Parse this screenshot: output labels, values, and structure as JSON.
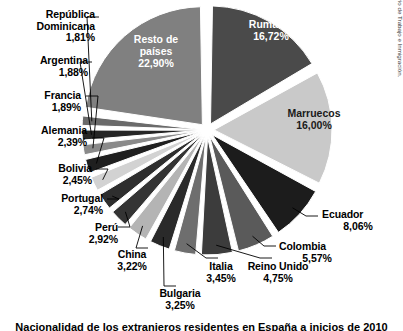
{
  "caption": "Nacionalidad de los extranjeros residentes en España a inicios de 2010",
  "credit": {
    "line1": "© Cengage Learning. Fuente: Ministerio de Trabajo e Inmigración.",
    "line2": "Gobierno de España, 2010"
  },
  "chart_data": {
    "type": "pie",
    "title": "Nacionalidad de los extranjeros residentes en España a inicios de 2010",
    "unit": "%",
    "legend": "none",
    "exploded": true,
    "start_angle_deg": -90,
    "direction": "clockwise",
    "labels_inside": [
      "Rumanía",
      "Marruecos",
      "Resto de países"
    ],
    "categories": [
      "Rumanía",
      "Marruecos",
      "Ecuador",
      "Colombia",
      "Reino Unido",
      "Italia",
      "Bulgaria",
      "China",
      "Perú",
      "Portugal",
      "Bolivia",
      "Alemania",
      "Francia",
      "Argentina",
      "República Dominicana",
      "Resto de países"
    ],
    "values": [
      16.72,
      16.0,
      8.06,
      5.57,
      4.75,
      3.45,
      3.25,
      3.22,
      2.92,
      2.74,
      2.45,
      2.39,
      1.89,
      1.88,
      1.81,
      22.9
    ],
    "value_labels": [
      "16,72%",
      "16,00%",
      "8,06%",
      "5,57%",
      "4,75%",
      "3,45%",
      "3,25%",
      "3,22%",
      "2,92%",
      "2,74%",
      "2,45%",
      "2,39%",
      "1,89%",
      "1,88%",
      "1,81%",
      "22,90%"
    ],
    "colors": [
      "#4a4a4a",
      "#c9c9c9",
      "#1c1c1c",
      "#5a5a5a",
      "#3c3c3c",
      "#6e6e6e",
      "#2a2a2a",
      "#b4b4b4",
      "#343434",
      "#2e2e2e",
      "#d2d2d2",
      "#1f1f1f",
      "#8a8a8a",
      "#262626",
      "#6a6a6a",
      "#808080"
    ],
    "slices": [
      {
        "label": "Rumanía",
        "value_label": "16,72%",
        "value": 16.72,
        "color": "#4a4a4a",
        "label_placement": "inside",
        "text_color": "#ffffff"
      },
      {
        "label": "Marruecos",
        "value_label": "16,00%",
        "value": 16.0,
        "color": "#c9c9c9",
        "label_placement": "inside",
        "text_color": "#1a1a1a"
      },
      {
        "label": "Ecuador",
        "value_label": "8,06%",
        "value": 8.06,
        "color": "#1c1c1c",
        "label_placement": "outside",
        "leader": true
      },
      {
        "label": "Colombia",
        "value_label": "5,57%",
        "value": 5.57,
        "color": "#5a5a5a",
        "label_placement": "outside",
        "leader": true
      },
      {
        "label": "Reino Unido",
        "value_label": "4,75%",
        "value": 4.75,
        "color": "#3c3c3c",
        "label_placement": "outside",
        "leader": true
      },
      {
        "label": "Italia",
        "value_label": "3,45%",
        "value": 3.45,
        "color": "#6e6e6e",
        "label_placement": "outside",
        "leader": true
      },
      {
        "label": "Bulgaria",
        "value_label": "3,25%",
        "value": 3.25,
        "color": "#2a2a2a",
        "label_placement": "outside",
        "leader": true
      },
      {
        "label": "China",
        "value_label": "3,22%",
        "value": 3.22,
        "color": "#b4b4b4",
        "label_placement": "outside",
        "leader": true
      },
      {
        "label": "Perú",
        "value_label": "2,92%",
        "value": 2.92,
        "color": "#343434",
        "label_placement": "outside",
        "leader": true
      },
      {
        "label": "Portugal",
        "value_label": "2,74%",
        "value": 2.74,
        "color": "#2e2e2e",
        "label_placement": "outside",
        "leader": true
      },
      {
        "label": "Bolivia",
        "value_label": "2,45%",
        "value": 2.45,
        "color": "#d2d2d2",
        "label_placement": "outside",
        "leader": true
      },
      {
        "label": "Alemania",
        "value_label": "2,39%",
        "value": 2.39,
        "color": "#1f1f1f",
        "label_placement": "outside",
        "leader": true
      },
      {
        "label": "Francia",
        "value_label": "1,89%",
        "value": 1.89,
        "color": "#8a8a8a",
        "label_placement": "outside",
        "leader": true
      },
      {
        "label": "Argentina",
        "value_label": "1,88%",
        "value": 1.88,
        "color": "#262626",
        "label_placement": "outside",
        "leader": true
      },
      {
        "label": "República Dominicana",
        "value_label": "1,81%",
        "value": 1.81,
        "color": "#6a6a6a",
        "label_placement": "outside",
        "leader": true,
        "name_line1": "República",
        "name_line2": "Dominicana"
      },
      {
        "label": "Resto de países",
        "value_label": "22,90%",
        "value": 22.9,
        "color": "#808080",
        "label_placement": "inside",
        "text_color": "#ffffff",
        "name_line1": "Resto de",
        "name_line2": "países"
      }
    ]
  },
  "labels": {
    "republica_dominicana": {
      "l1": "República",
      "l2": "Dominicana",
      "pct": "1,81%"
    },
    "argentina": {
      "nm": "Argentina",
      "pct": "1,88%"
    },
    "francia": {
      "nm": "Francia",
      "pct": "1,89%"
    },
    "alemania": {
      "nm": "Alemania",
      "pct": "2,39%"
    },
    "bolivia": {
      "nm": "Bolivia",
      "pct": "2,45%"
    },
    "portugal": {
      "nm": "Portugal",
      "pct": "2,74%"
    },
    "peru": {
      "nm": "Perú",
      "pct": "2,92%"
    },
    "china": {
      "nm": "China",
      "pct": "3,22%"
    },
    "bulgaria": {
      "nm": "Bulgaria",
      "pct": "3,25%"
    },
    "italia": {
      "nm": "Italia",
      "pct": "3,45%"
    },
    "reino_unido": {
      "nm": "Reino Unido",
      "pct": "4,75%"
    },
    "colombia": {
      "nm": "Colombia",
      "pct": "5,57%"
    },
    "ecuador": {
      "nm": "Ecuador",
      "pct": "8,06%"
    },
    "marruecos": {
      "nm": "Marruecos",
      "pct": "16,00%"
    },
    "rumania": {
      "nm": "Rumanía",
      "pct": "16,72%"
    },
    "resto": {
      "l1": "Resto de",
      "l2": "países",
      "pct": "22,90%"
    }
  }
}
